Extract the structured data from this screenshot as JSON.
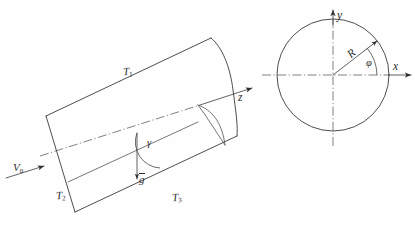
{
  "figure": {
    "page_mark": "",
    "ink_color": "#3a3a3a"
  },
  "cylinder": {
    "labels": {
      "top_wall": "T",
      "top_wall_sub": "1",
      "left_end": "T",
      "left_end_sub": "2",
      "bottom_wall": "T",
      "bottom_wall_sub": "3"
    },
    "velocity": {
      "symbol": "V",
      "subscript": "0"
    },
    "gravity": {
      "symbol": "g",
      "vector": true
    },
    "inclination_angle": {
      "symbol": "γ"
    },
    "axis": {
      "label": "z"
    }
  },
  "cross_section": {
    "x_axis_label": "x",
    "y_axis_label": "y",
    "radius_label": "R",
    "polar_angle_label": "φ"
  }
}
